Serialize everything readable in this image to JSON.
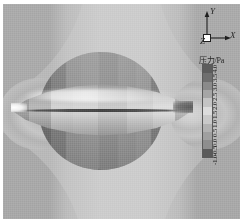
{
  "figure": {
    "type": "cfd-pressure-contour"
  },
  "axis_triad": {
    "name": "coordinate-axes",
    "y_label": "Y",
    "x_label": "X",
    "z_label": "Z"
  },
  "legend": {
    "title": "压力/Pa",
    "orientation": "vertical",
    "tick_labels": [
      "4.0",
      "3.5",
      "3.0",
      "2.5",
      "2.0",
      "1.5",
      "1.0",
      "0.5",
      "0.0",
      "-0.5",
      "-1.0"
    ],
    "colors": [
      "#5c5c5c",
      "#6e6e6e",
      "#8a8a8a",
      "#a6a6a6",
      "#c4c4c4",
      "#dcdcdc",
      "#c9c9c9",
      "#b2b2b2",
      "#a0a0a0",
      "#8e8e8e",
      "#5a5a5a"
    ]
  },
  "chart_data": {
    "type": "heatmap",
    "title": "",
    "xlabel": "X",
    "ylabel": "Y",
    "colorbar_label": "压力/Pa",
    "colorbar_ticks": [
      4.0,
      3.5,
      3.0,
      2.5,
      2.0,
      1.5,
      1.0,
      0.5,
      0.0,
      -0.5,
      -1.0
    ],
    "vmin": -1.0,
    "vmax": 4.0,
    "colormap": "grayscale",
    "grid": false,
    "legend_position": "right",
    "features": [
      {
        "name": "bow-shock-halo-nose",
        "x_frac": 0.1,
        "y_frac": 0.5,
        "value": 4.0
      },
      {
        "name": "nose-stagnation-tip",
        "x_frac": 0.07,
        "y_frac": 0.5,
        "value": 4.0
      },
      {
        "name": "forebody-expansion",
        "x_frac": 0.26,
        "y_frac": 0.5,
        "value": 1.5
      },
      {
        "name": "mid-body-band",
        "x_frac": 0.5,
        "y_frac": 0.5,
        "value": 0.5
      },
      {
        "name": "afterbody-recompression",
        "x_frac": 0.74,
        "y_frac": 0.5,
        "value": 1.0
      },
      {
        "name": "tail-wake-halo",
        "x_frac": 0.9,
        "y_frac": 0.5,
        "value": -0.5
      },
      {
        "name": "outer-freestream",
        "x_frac": 0.02,
        "y_frac": 0.05,
        "value": 0.0
      }
    ]
  },
  "body": {
    "shape": "axisymmetric-spindle",
    "surface_bands": [
      {
        "x_frac": 0.0,
        "width_frac": 0.1,
        "value": 4.0
      },
      {
        "x_frac": 0.1,
        "width_frac": 0.12,
        "value": 3.0
      },
      {
        "x_frac": 0.22,
        "width_frac": 0.12,
        "value": 2.0
      },
      {
        "x_frac": 0.34,
        "width_frac": 0.14,
        "value": 1.0
      },
      {
        "x_frac": 0.48,
        "width_frac": 0.16,
        "value": 0.5
      },
      {
        "x_frac": 0.64,
        "width_frac": 0.14,
        "value": 1.0
      },
      {
        "x_frac": 0.78,
        "width_frac": 0.12,
        "value": 1.5
      },
      {
        "x_frac": 0.9,
        "width_frac": 0.1,
        "value": -0.5
      }
    ]
  }
}
